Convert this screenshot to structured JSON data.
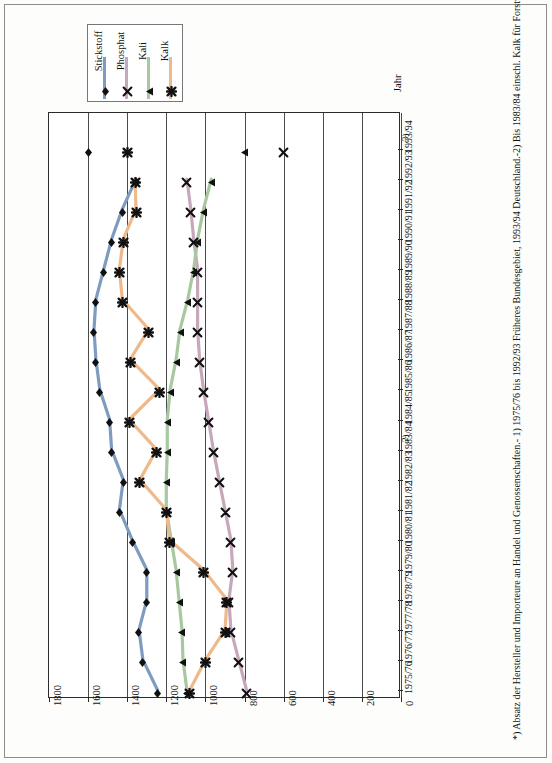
{
  "legend": {
    "items": [
      {
        "label": "Stickstoff",
        "color": "#7e9cc0",
        "marker": "diamond",
        "name": "legend-stickstoff"
      },
      {
        "label": "Phosphat",
        "color": "#c7a8bb",
        "marker": "x",
        "name": "legend-phosphat"
      },
      {
        "label": "Kali",
        "color": "#a8c8a0",
        "marker": "triangle",
        "name": "legend-kali"
      },
      {
        "label": "Kalk",
        "color": "#eeba8c",
        "marker": "star",
        "name": "legend-kalk"
      }
    ]
  },
  "axis": {
    "value_axis_title": "",
    "category_axis_title": "Jahr",
    "value_ticks": [
      "1800",
      "1600",
      "1400",
      "1200",
      "1000",
      "800",
      "600",
      "400",
      "200",
      "0"
    ]
  },
  "footnote": "*) Absatz der Hersteller und Importeure an Handel und Genossenschaften.- 1) 1975/76 bis 1992/93 Früheres Bundesgebiet, 1993/94 Deutschland.-2) Bis 1983/84 einschl. Kalk für Forstwirtschaft.- 3) Bezogen auf die landwirtschaftlich genutzte Fläche ohne Brache.-",
  "year_superscripts": {
    "1983/84": "2)",
    "1993/94": "3)"
  },
  "chart_data": {
    "type": "line",
    "orientation": "horizontal",
    "title": "",
    "xlabel": "",
    "ylabel": "Jahr",
    "xlim": [
      1800,
      0
    ],
    "grid": true,
    "legend_position": "top-left",
    "categories": [
      "1975/76",
      "1976/77",
      "1977/78",
      "1978/79",
      "1979/80",
      "1980/81",
      "1981/82",
      "1982/83",
      "1983/84",
      "1984/85",
      "1985/86",
      "1986/87",
      "1987/88",
      "1988/89",
      "1989/90",
      "1990/91",
      "1991/92",
      "1992/93",
      "1993/94"
    ],
    "series": [
      {
        "name": "Stickstoff",
        "color": "#7e9cc0",
        "marker": "diamond",
        "values": [
          1245,
          1320,
          1340,
          1300,
          1300,
          1375,
          1440,
          1420,
          1480,
          1490,
          1540,
          1560,
          1570,
          1560,
          1520,
          1480,
          1425,
          1355,
          1600
        ]
      },
      {
        "name": "Phosphat",
        "color": "#c7a8bb",
        "marker": "x",
        "values": [
          790,
          830,
          870,
          880,
          860,
          870,
          900,
          930,
          960,
          985,
          1010,
          1030,
          1040,
          1040,
          1040,
          1060,
          1075,
          1095,
          600
        ]
      },
      {
        "name": "Kali",
        "color": "#a8c8a0",
        "marker": "triangle",
        "values": [
          1095,
          1115,
          1120,
          1135,
          1150,
          1175,
          1200,
          1200,
          1195,
          1195,
          1180,
          1150,
          1130,
          1090,
          1060,
          1040,
          1010,
          970,
          800
        ]
      },
      {
        "name": "Kalk",
        "color": "#eeba8c",
        "marker": "star",
        "values": [
          1080,
          1000,
          900,
          890,
          1010,
          1185,
          1200,
          1335,
          1250,
          1390,
          1235,
          1385,
          1290,
          1425,
          1440,
          1420,
          1355,
          1360,
          1400
        ]
      }
    ]
  }
}
